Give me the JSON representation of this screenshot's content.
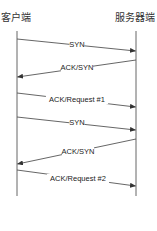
{
  "actors": {
    "client": "客户端",
    "server": "服务器端"
  },
  "lifelines": {
    "client_x": 17,
    "server_x": 136,
    "top_y": 31,
    "bottom_y": 196
  },
  "messages": [
    {
      "label": "SYN",
      "from": "client",
      "to": "server",
      "y1": 39,
      "y2": 51,
      "lx": 77,
      "ly": 47
    },
    {
      "label": "ACK/SYN",
      "from": "server",
      "to": "client",
      "y1": 60,
      "y2": 77,
      "lx": 77,
      "ly": 70
    },
    {
      "label": "ACK/Request #1",
      "from": "client",
      "to": "server",
      "y1": 93,
      "y2": 107,
      "lx": 77,
      "ly": 102
    },
    {
      "label": "SYN",
      "from": "client",
      "to": "server",
      "y1": 117,
      "y2": 130,
      "lx": 77,
      "ly": 125
    },
    {
      "label": "ACK/SYN",
      "from": "server",
      "to": "client",
      "y1": 139,
      "y2": 164,
      "lx": 78,
      "ly": 154
    },
    {
      "label": "ACK/Request #2",
      "from": "client",
      "to": "server",
      "y1": 170,
      "y2": 186,
      "lx": 78,
      "ly": 181
    }
  ],
  "colors": {
    "line": "#555555",
    "text": "#222222"
  }
}
